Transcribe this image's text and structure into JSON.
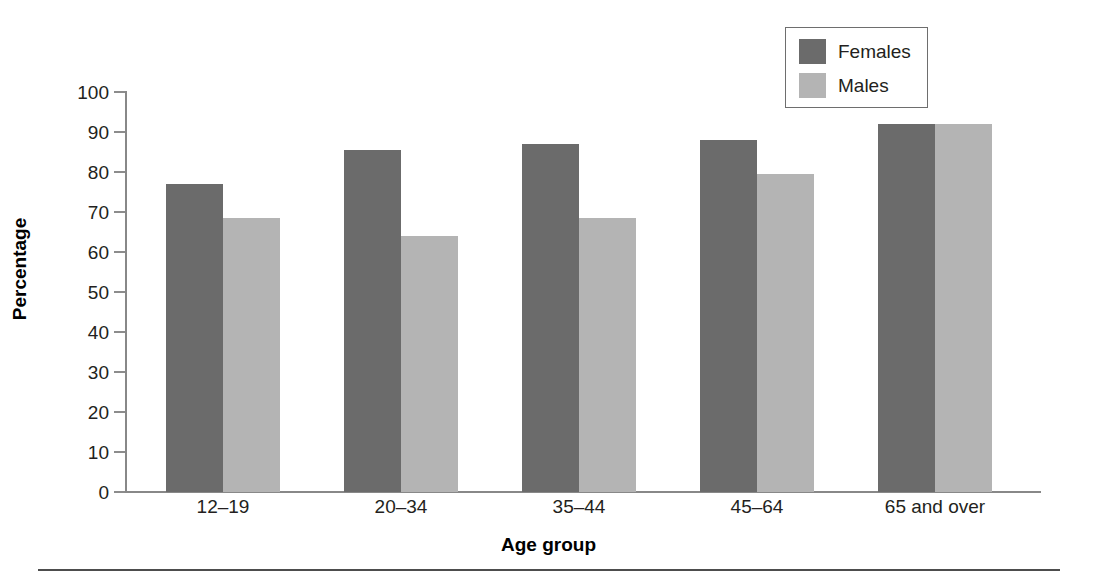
{
  "chart_data": {
    "type": "bar",
    "title": "",
    "subtitle": "",
    "xlabel": "Age group",
    "ylabel": "Percentage",
    "categories": [
      "12–19",
      "20–34",
      "35–44",
      "45–64",
      "65 and over"
    ],
    "series": [
      {
        "name": "Females",
        "color": "#6b6b6b",
        "values": [
          77,
          85.5,
          87,
          88,
          92
        ]
      },
      {
        "name": "Males",
        "color": "#b4b4b4",
        "values": [
          68.5,
          64,
          68.5,
          79.5,
          92
        ]
      }
    ],
    "ylim": [
      0,
      100
    ],
    "ytick_values": [
      0,
      10,
      20,
      30,
      40,
      50,
      60,
      70,
      80,
      90,
      100
    ],
    "ytick_labels": [
      "0",
      "10",
      "20",
      "30",
      "40",
      "50",
      "60",
      "70",
      "80",
      "90",
      "100"
    ],
    "grid": false,
    "legend_position": "top-right"
  },
  "legend": {
    "entries": [
      {
        "label": "Females",
        "swatch": "dark-gray-swatch"
      },
      {
        "label": "Males",
        "swatch": "light-gray-swatch"
      }
    ]
  },
  "colors": {
    "females": "#6b6b6b",
    "males": "#b4b4b4",
    "axis": "#888888",
    "text": "#231f20",
    "rule": "#4d4d4d"
  }
}
